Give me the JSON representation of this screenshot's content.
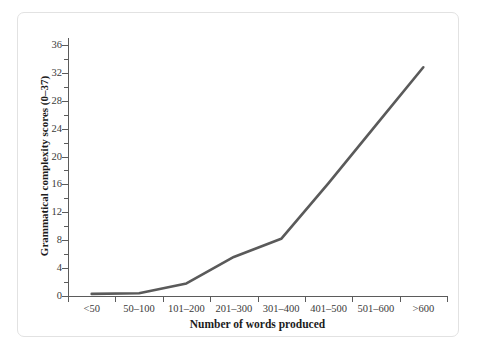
{
  "chart_data": {
    "type": "line",
    "title": "",
    "subtitle": "",
    "xlabel": "Number of words produced",
    "ylabel": "Grammatical complexity scores (0–37)",
    "categories": [
      "<50",
      "50–100",
      "101–200",
      "201–300",
      "301–400",
      "401–500",
      "501–600",
      ">600"
    ],
    "values": [
      0.3,
      0.4,
      1.8,
      5.6,
      8.2,
      16.2,
      24.5,
      32.8
    ],
    "series": [
      {
        "name": "Grammatical complexity",
        "values": [
          0.3,
          0.4,
          1.8,
          5.6,
          8.2,
          16.2,
          24.5,
          32.8
        ]
      }
    ],
    "ylim": [
      0,
      37
    ],
    "xlim": [
      0,
      7
    ],
    "ytick_labels": [
      "0",
      "4",
      "8",
      "12",
      "16",
      "20",
      "24",
      "28",
      "32",
      "36"
    ],
    "ytick_values": [
      0,
      4,
      8,
      12,
      16,
      20,
      24,
      28,
      32,
      36
    ],
    "yminor_values": [
      2,
      6,
      10,
      14,
      18,
      22,
      26,
      30,
      34
    ],
    "grid": false,
    "legend": false,
    "legend_position": "none",
    "line_color": "#5a5a5a",
    "line_width": 2.6,
    "axis_color": "#5b5b5b",
    "background_color": "#ffffff",
    "frame_color": "#e2e2e2"
  }
}
